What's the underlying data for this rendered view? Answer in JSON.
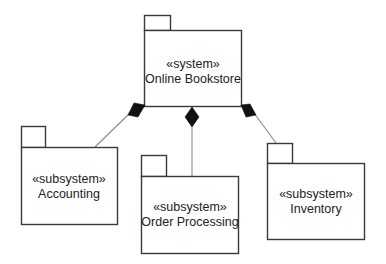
{
  "diagram": {
    "type": "UML package diagram",
    "relationship": "composition",
    "colors": {
      "line": "#3a3a3a",
      "connector": "#8a8a8a",
      "diamond": "#111111",
      "text": "#222222",
      "background": "#ffffff"
    },
    "packages": [
      {
        "id": "system",
        "stereotype": "«system»",
        "name": "Online Bookstore"
      },
      {
        "id": "accounting",
        "stereotype": "«subsystem»",
        "name": "Accounting"
      },
      {
        "id": "order-processing",
        "stereotype": "«subsystem»",
        "name": "Order Processing"
      },
      {
        "id": "inventory",
        "stereotype": "«subsystem»",
        "name": "Inventory"
      }
    ],
    "relations": [
      {
        "whole": "system",
        "part": "accounting",
        "kind": "composition"
      },
      {
        "whole": "system",
        "part": "order-processing",
        "kind": "composition"
      },
      {
        "whole": "system",
        "part": "inventory",
        "kind": "composition"
      }
    ]
  }
}
